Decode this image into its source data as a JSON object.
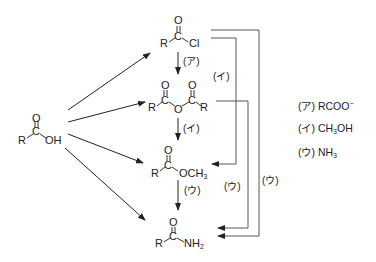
{
  "compounds": {
    "carboxylic_acid": {
      "O": "O",
      "C": "C",
      "R": "R",
      "group": "OH"
    },
    "acid_chloride": {
      "O": "O",
      "C": "C",
      "R": "R",
      "group": "Cl"
    },
    "anhydride": {
      "O1": "O",
      "O2": "O",
      "C1": "C",
      "C2": "C",
      "R1": "R",
      "bridge": "O",
      "R2": "R"
    },
    "ester": {
      "O": "O",
      "C": "C",
      "R": "R",
      "group": "OCH",
      "sub": "3"
    },
    "amide": {
      "O": "O",
      "C": "C",
      "R": "R",
      "group": "NH",
      "sub": "2"
    }
  },
  "arrow_labels": {
    "chloride_to_anhydride": "(ア)",
    "chloride_to_ester": "(イ)",
    "anhydride_to_ester": "(イ)",
    "ester_to_amide": "(ウ)",
    "anhydride_to_amide": "(ウ)",
    "chloride_to_amide": "(ウ)"
  },
  "legend": [
    {
      "key": "(ア)",
      "reagent": "RCOO",
      "sup": "−",
      "sub": ""
    },
    {
      "key": "(イ)",
      "reagent": "CH",
      "sub": "3",
      "tail": "OH"
    },
    {
      "key": "(ウ)",
      "reagent": "NH",
      "sub": "3",
      "tail": ""
    }
  ],
  "colors": {
    "line": "#333333",
    "bracket": "#555555"
  }
}
